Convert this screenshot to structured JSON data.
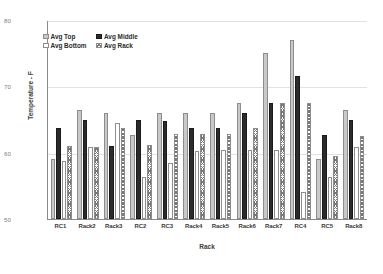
{
  "chart_data": {
    "type": "bar",
    "title": "",
    "xlabel": "Rack",
    "ylabel": "Temperature - F",
    "ylim": [
      50,
      80
    ],
    "yticks": [
      50,
      60,
      70,
      80
    ],
    "grid": true,
    "legend_position": "top-left",
    "categories": [
      "RC1",
      "Rack2",
      "Rack3",
      "RC2",
      "RC3",
      "Rack4",
      "Rack5",
      "Rack6",
      "Rack7",
      "RC4",
      "RC5",
      "Rack8"
    ],
    "series": [
      {
        "name": "Avg Top",
        "color": "#c9c9c9",
        "pattern": "solid-light-gray",
        "values": [
          59.0,
          66.5,
          66.0,
          62.7,
          66.0,
          66.0,
          66.0,
          67.5,
          75.0,
          77.0,
          59.0,
          66.5
        ]
      },
      {
        "name": "Avg Middle",
        "color": "#2b2b2b",
        "pattern": "solid-black",
        "values": [
          63.7,
          64.9,
          61.0,
          64.9,
          64.8,
          63.7,
          63.7,
          66.0,
          67.5,
          71.5,
          62.7,
          64.9
        ]
      },
      {
        "name": "Avg Bottom",
        "color": "#ffffff",
        "pattern": "open-white",
        "values": [
          58.8,
          60.8,
          64.5,
          56.3,
          58.5,
          60.2,
          60.4,
          60.4,
          60.4,
          54.0,
          56.3,
          60.8
        ]
      },
      {
        "name": "Avg Rack",
        "color": "#777777",
        "pattern": "cross-hatch",
        "values": [
          61.0,
          60.8,
          63.7,
          61.2,
          62.8,
          62.8,
          62.8,
          63.7,
          67.5,
          67.5,
          59.5,
          62.5
        ]
      }
    ]
  },
  "legend": {
    "items": [
      {
        "label": "Avg Top"
      },
      {
        "label": "Avg Middle"
      },
      {
        "label": "Avg Bottom"
      },
      {
        "label": "Avg Rack"
      }
    ]
  },
  "axes": {
    "y_title": "Temperature - F",
    "x_title": "Rack",
    "y_tick_labels": [
      "80",
      "70",
      "60",
      "50"
    ],
    "x_tick_labels": [
      "RC1",
      "Rack2",
      "Rack3",
      "RC2",
      "RC3",
      "Rack4",
      "Rack5",
      "Rack6",
      "Rack7",
      "RC4",
      "RC5",
      "Rack8"
    ]
  }
}
